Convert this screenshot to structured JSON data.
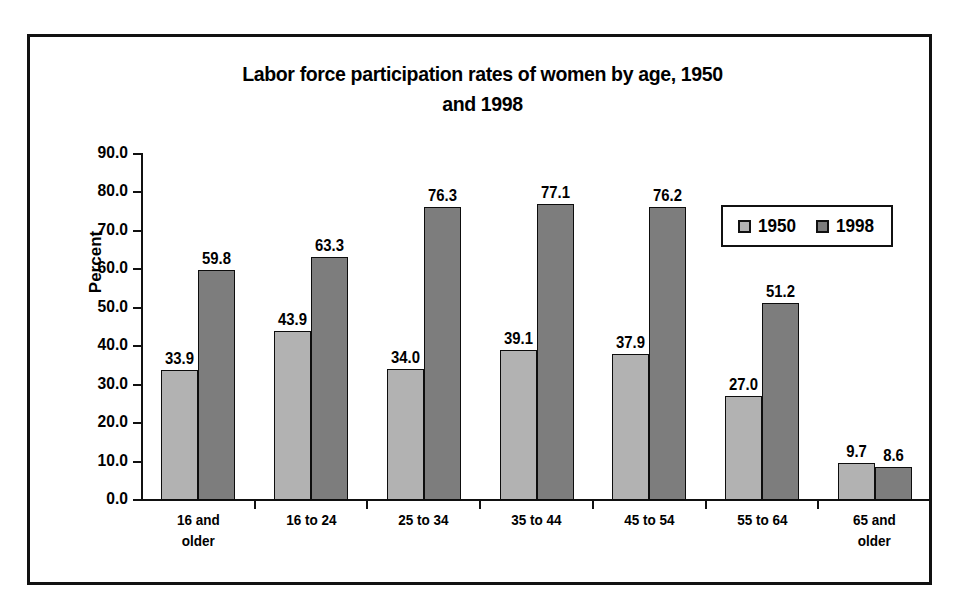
{
  "chart_data": {
    "type": "bar",
    "title": "Labor force participation rates of women by age, 1950 and 1998",
    "title_line1": "Labor force participation rates of women by age, 1950",
    "title_line2": "and 1998",
    "xlabel": "",
    "ylabel": "Percent",
    "ylim": [
      0.0,
      90.0
    ],
    "ytick_step": 10.0,
    "ytick_labels": [
      "90.0",
      "80.0",
      "70.0",
      "60.0",
      "50.0",
      "40.0",
      "30.0",
      "20.0",
      "10.0",
      "0.0"
    ],
    "ytick_values": [
      90.0,
      80.0,
      70.0,
      60.0,
      50.0,
      40.0,
      30.0,
      20.0,
      10.0,
      0.0
    ],
    "grid": false,
    "legend_position": "upper-right-inside",
    "categories": [
      "16 and older",
      "16 to 24",
      "25 to 34",
      "35 to 44",
      "45 to 54",
      "55 to 64",
      "65 and older"
    ],
    "category_lines": [
      [
        "16 and",
        "older"
      ],
      [
        "16 to 24",
        ""
      ],
      [
        "25 to 34",
        ""
      ],
      [
        "35 to 44",
        ""
      ],
      [
        "45 to 54",
        ""
      ],
      [
        "55 to 64",
        ""
      ],
      [
        "65 and",
        "older"
      ]
    ],
    "series": [
      {
        "name": "1950",
        "color": "#b2b2b2",
        "values": [
          33.9,
          43.9,
          34.0,
          39.1,
          37.9,
          27.0,
          9.7
        ],
        "labels": [
          "33.9",
          "43.9",
          "34.0",
          "39.1",
          "37.9",
          "27.0",
          "9.7"
        ]
      },
      {
        "name": "1998",
        "color": "#7d7d7d",
        "values": [
          59.8,
          63.3,
          76.3,
          77.1,
          76.2,
          51.2,
          8.6
        ],
        "labels": [
          "59.8",
          "63.3",
          "76.3",
          "77.1",
          "76.2",
          "51.2",
          "8.6"
        ]
      }
    ]
  },
  "legend": {
    "items": [
      {
        "label": "1950",
        "color": "#b2b2b2"
      },
      {
        "label": "1998",
        "color": "#7d7d7d"
      }
    ]
  },
  "caption": {
    "text": ""
  },
  "colors": {
    "series_1950": "#b2b2b2",
    "series_1998": "#7d7d7d",
    "ink": "#111111",
    "background": "#ffffff"
  }
}
